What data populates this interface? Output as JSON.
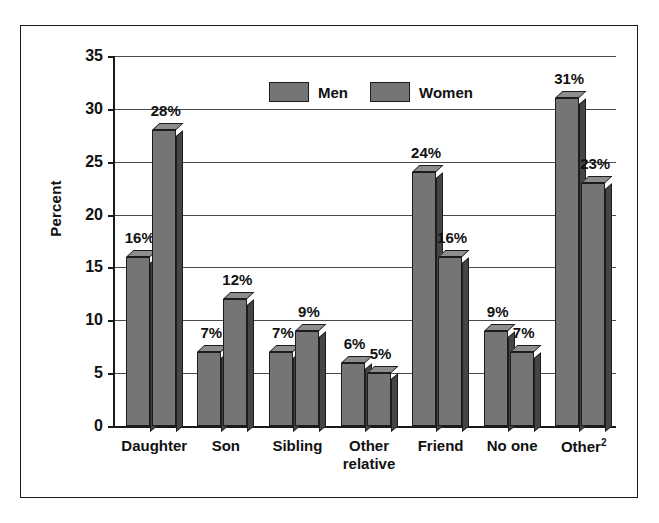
{
  "chart_data": {
    "type": "bar",
    "title": "",
    "subtitle": "",
    "xlabel": "",
    "ylabel": "Percent",
    "ylim": [
      0,
      35
    ],
    "ytick_step": 5,
    "yticks": [
      0,
      5,
      10,
      15,
      20,
      25,
      30,
      35
    ],
    "ytick_labels": [
      "0",
      "5",
      "10",
      "15",
      "20",
      "25",
      "30",
      "35"
    ],
    "grid": true,
    "grid_axis": "y",
    "legend_position": "top-center",
    "value_label_suffix": "%",
    "categories": [
      "Daughter",
      "Son",
      "Sibling",
      "Other relative",
      "Friend",
      "No one",
      "Other²"
    ],
    "category_lines": [
      [
        "Daughter"
      ],
      [
        "Son"
      ],
      [
        "Sibling"
      ],
      [
        "Other",
        "relative"
      ],
      [
        "Friend"
      ],
      [
        "No one"
      ],
      [
        "Other²"
      ]
    ],
    "series": [
      {
        "name": "Men",
        "color": "#757575",
        "values": [
          16,
          7,
          7,
          6,
          24,
          9,
          31
        ],
        "labels": [
          "16%",
          "7%",
          "7%",
          "6%",
          "24%",
          "9%",
          "31%"
        ]
      },
      {
        "name": "Women",
        "color": "#757575",
        "values": [
          28,
          12,
          9,
          5,
          16,
          7,
          23
        ],
        "labels": [
          "28%",
          "12%",
          "9%",
          "5%",
          "16%",
          "7%",
          "23%"
        ]
      }
    ]
  },
  "legend": {
    "entries": [
      {
        "label": "Men",
        "color": "#757575"
      },
      {
        "label": "Women",
        "color": "#757575"
      }
    ]
  },
  "axes": {
    "y_title": "Percent"
  },
  "colors": {
    "bar_front": "#757575",
    "bar_side": "#454545",
    "bar_top": "#8d8d8d",
    "outline": "#1c1c1c",
    "gridline": "#4a4a4a",
    "frame": "#1a1a1a",
    "text": "#111111",
    "background": "#ffffff"
  }
}
